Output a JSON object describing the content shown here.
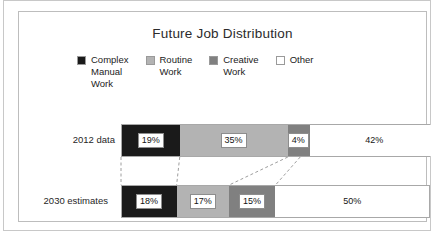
{
  "chart_data": {
    "type": "bar",
    "orientation": "horizontal-stacked",
    "title": "Future Job Distribution",
    "xlabel": "",
    "ylabel": "",
    "xlim": [
      0,
      100
    ],
    "grid": false,
    "legend_position": "top",
    "categories": [
      "2012 data",
      "2030 estimates"
    ],
    "series": [
      {
        "name": "Complex Manual Work",
        "color": "#1a1a1a",
        "values": [
          19,
          18
        ],
        "labels": [
          "19%",
          "18%"
        ]
      },
      {
        "name": "Routine Work",
        "color": "#b3b3b3",
        "values": [
          35,
          17
        ],
        "labels": [
          "35%",
          "17%"
        ]
      },
      {
        "name": "Creative Work",
        "color": "#808080",
        "values": [
          4,
          15
        ],
        "labels": [
          "4%",
          "15%"
        ]
      },
      {
        "name": "Other",
        "color": "#ffffff",
        "values": [
          42,
          50
        ],
        "labels": [
          "42%",
          "50%"
        ]
      }
    ]
  },
  "chart": {
    "title": "Future Job Distribution",
    "legend": [
      {
        "label": "Complex\nManual\nWork",
        "swatch": "#1a1a1a",
        "name": "legend-complex-manual-work"
      },
      {
        "label": "Routine\nWork",
        "swatch": "#b3b3b3",
        "name": "legend-routine-work"
      },
      {
        "label": "Creative\nWork",
        "swatch": "#808080",
        "name": "legend-creative-work"
      },
      {
        "label": "Other",
        "swatch": "#ffffff",
        "name": "legend-other"
      }
    ],
    "rows": [
      {
        "label": "2012 data",
        "segments": [
          {
            "value": "19%",
            "pct": 19,
            "color": "#1a1a1a",
            "boxed": true
          },
          {
            "value": "35%",
            "pct": 35,
            "color": "#b3b3b3",
            "boxed": true
          },
          {
            "value": "4%",
            "pct": 4,
            "color": "#808080",
            "boxed": true
          },
          {
            "value": "42%",
            "pct": 42,
            "color": "#ffffff",
            "boxed": false
          }
        ]
      },
      {
        "label": "2030 estimates",
        "segments": [
          {
            "value": "18%",
            "pct": 18,
            "color": "#1a1a1a",
            "boxed": true
          },
          {
            "value": "17%",
            "pct": 17,
            "color": "#b3b3b3",
            "boxed": true
          },
          {
            "value": "15%",
            "pct": 15,
            "color": "#808080",
            "boxed": true
          },
          {
            "value": "50%",
            "pct": 50,
            "color": "#ffffff",
            "boxed": false
          }
        ]
      }
    ]
  }
}
